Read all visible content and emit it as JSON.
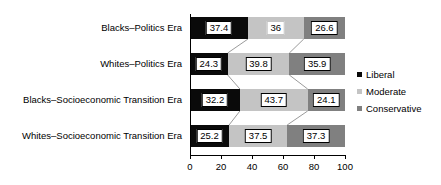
{
  "chart_data": {
    "type": "bar",
    "orientation": "horizontal",
    "stacked": true,
    "percent": true,
    "title": "",
    "subtitle": "",
    "xlabel": "",
    "ylabel": "",
    "xlim": [
      0,
      100
    ],
    "xticks": [
      0,
      20,
      40,
      60,
      80,
      100
    ],
    "xtick_labels": [
      "0",
      "20",
      "40",
      "60",
      "80",
      "100"
    ],
    "grid": false,
    "legend_position": "right",
    "categories": [
      "Blacks–Politics Era",
      "Whites–Politics Era",
      "Blacks–Socioeconomic Transition Era",
      "Whites–Socioeconomic Transition Era"
    ],
    "series": [
      {
        "name": "Liberal",
        "color": "#0a0a0a",
        "values": [
          37.4,
          24.3,
          32.2,
          25.2
        ],
        "labels": [
          "37.4",
          "24.3",
          "32.2",
          "25.2"
        ]
      },
      {
        "name": "Moderate",
        "color": "#c4c4c4",
        "values": [
          36,
          39.8,
          43.7,
          37.5
        ],
        "labels": [
          "36",
          "39.8",
          "43.7",
          "37.5"
        ]
      },
      {
        "name": "Conservative",
        "color": "#808080",
        "values": [
          26.6,
          35.9,
          24.1,
          37.3
        ],
        "labels": [
          "26.6",
          "35.9",
          "24.1",
          "37.3"
        ]
      }
    ]
  },
  "legend": {
    "items": [
      {
        "label": "Liberal",
        "color": "#0a0a0a",
        "marker": "square-marker"
      },
      {
        "label": "Moderate",
        "color": "#c4c4c4",
        "marker": "square-marker"
      },
      {
        "label": "Conservative",
        "color": "#808080",
        "marker": "square-marker"
      }
    ]
  }
}
